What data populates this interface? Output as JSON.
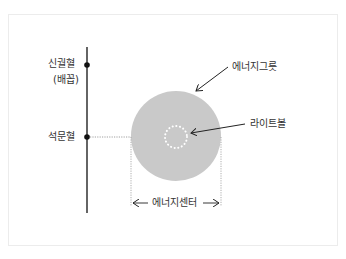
{
  "labels": {
    "shingwolhyeol": "신궐혈",
    "baekkop": "(배꼽)",
    "seokmunhyeol": "석문혈",
    "energy_bowl": "에너지그릇",
    "light_ball": "라이트볼",
    "energy_center": "에너지센터"
  },
  "colors": {
    "circle_fill": "#c9c9c9",
    "line": "#111111",
    "dotted": "#888888",
    "light_ball_dots": "#ffffff"
  }
}
